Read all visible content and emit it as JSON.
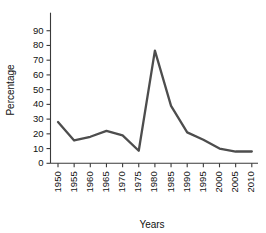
{
  "chart_data": {
    "type": "line",
    "title": "",
    "xlabel": "Years",
    "ylabel": "Percentage",
    "categories": [
      "1950",
      "1955",
      "1960",
      "1965",
      "1970",
      "1975",
      "1980",
      "1985",
      "1990",
      "1995",
      "2000",
      "2005",
      "2010"
    ],
    "values": [
      28,
      15.5,
      18,
      22,
      19,
      8.5,
      76.5,
      39,
      21,
      16,
      10,
      8,
      8
    ],
    "ylim": [
      0,
      90
    ],
    "ytick_labels": [
      "0",
      "10",
      "20",
      "30",
      "40",
      "50",
      "60",
      "70",
      "80",
      "90"
    ],
    "ytick_values": [
      0,
      10,
      20,
      30,
      40,
      50,
      60,
      70,
      80,
      90
    ],
    "xtick_labels": [
      "1950",
      "1955",
      "1960",
      "1965",
      "1970",
      "1975",
      "1980",
      "1985",
      "1990",
      "1995",
      "2000",
      "2005",
      "2010"
    ],
    "grid": false,
    "legend": false,
    "legend_position": "none",
    "series": [
      {
        "name": "Percentage",
        "color": "#4d4d4d",
        "values": [
          28,
          15.5,
          18,
          22,
          19,
          8.5,
          76.5,
          39,
          21,
          16,
          10,
          8,
          8
        ]
      }
    ]
  },
  "colors": {
    "line": "#4d4d4d",
    "axis": "#3a3a3a",
    "text": "#111111",
    "background": "#ffffff"
  }
}
